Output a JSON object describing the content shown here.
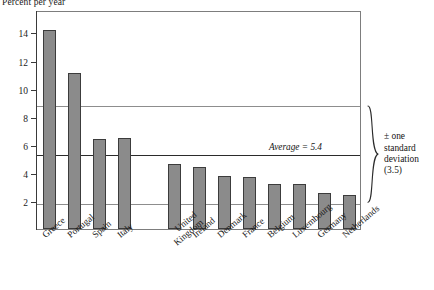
{
  "chart_data": {
    "type": "bar",
    "title": "Percent per year",
    "xlabel": "",
    "ylabel": "Percent per year",
    "categories": [
      "Greece",
      "Portugal",
      "Spain",
      "Italy",
      "United\nKingdom",
      "Ireland",
      "Denmark",
      "France",
      "Belgium",
      "Luxembourg",
      "Germany",
      "Netherlands"
    ],
    "categories_display": [
      {
        "line1": "Greece",
        "line2": ""
      },
      {
        "line1": "Portugal",
        "line2": ""
      },
      {
        "line1": "Spain",
        "line2": ""
      },
      {
        "line1": "Italy",
        "line2": ""
      },
      {
        "line1": "United",
        "line2": "Kingdom"
      },
      {
        "line1": "Ireland",
        "line2": ""
      },
      {
        "line1": "Denmark",
        "line2": ""
      },
      {
        "line1": "France",
        "line2": ""
      },
      {
        "line1": "Belgium",
        "line2": ""
      },
      {
        "line1": "Luxembourg",
        "line2": ""
      },
      {
        "line1": "Germany",
        "line2": ""
      },
      {
        "line1": "Netherlands",
        "line2": ""
      }
    ],
    "values": [
      14.2,
      11.1,
      6.4,
      6.45,
      4.6,
      4.4,
      3.8,
      3.7,
      3.2,
      3.2,
      2.55,
      2.4
    ],
    "bar_count": 13,
    "ylim": [
      0,
      15.6
    ],
    "yticks": [
      2,
      4,
      6,
      8,
      10,
      12,
      14
    ],
    "ytick_labels": [
      "2",
      "4",
      "6",
      "8",
      "10",
      "12",
      "14"
    ],
    "grid": false,
    "legend": "none",
    "bar_color": "#8b8b8b",
    "bar_edge_color": "#3c3c3c",
    "reference_lines": [
      {
        "name": "upper-sd",
        "value": 8.9,
        "style": "thin"
      },
      {
        "name": "average",
        "value": 5.4,
        "style": "thick"
      },
      {
        "name": "lower-sd",
        "value": 1.9,
        "style": "thin"
      }
    ],
    "annotations": [
      {
        "name": "average-label",
        "text": "Average = 5.4",
        "value": 5.4
      },
      {
        "name": "sd-note",
        "lines": [
          "± one",
          "standard",
          "deviation",
          "(3.5)"
        ],
        "std_dev": 3.5
      }
    ]
  },
  "average": {
    "label": "Average = 5.4"
  },
  "std_note": {
    "line1": "± one",
    "line2": "standard",
    "line3": "deviation",
    "line4": "(3.5)"
  }
}
